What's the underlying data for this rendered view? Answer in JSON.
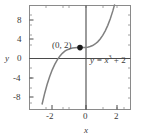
{
  "chart_data": {
    "type": "line",
    "title": "",
    "xlabel": "x",
    "ylabel": "y",
    "equation_label": "y = x",
    "equation_exponent": "3",
    "equation_tail": " + 2",
    "equation_full": "y = x^3 + 2",
    "function": "y = x^3 + 2",
    "xlim": [
      -3,
      3
    ],
    "ylim": [
      -10.5,
      10.5
    ],
    "grid": false,
    "legend": "none",
    "xticks": [
      -2,
      0,
      2
    ],
    "xtick_labels": [
      "-2",
      "0",
      "2"
    ],
    "yticks": [
      -8,
      -4,
      0,
      4,
      8
    ],
    "ytick_labels": [
      "-8",
      "-4",
      "0",
      "4",
      "8"
    ],
    "minor_xticks": [
      -2.5,
      -1.5,
      -1,
      -0.5,
      0.5,
      1,
      1.5,
      2.5
    ],
    "minor_yticks": [
      -10,
      -9,
      -7,
      -6,
      -5,
      -3,
      -2,
      -1,
      1,
      2,
      3,
      5,
      6,
      7,
      9,
      10
    ],
    "annotations": [
      {
        "name": "y-intercept-point",
        "label": "(0, 2)",
        "x": 0,
        "y": 2,
        "marker": "filled-circle"
      }
    ],
    "series": [
      {
        "name": "cubic-curve",
        "color": "#808080",
        "x": [
          -2.25,
          -2.1,
          -1.95,
          -1.8,
          -1.65,
          -1.5,
          -1.35,
          -1.2,
          -1.05,
          -0.9,
          -0.75,
          -0.6,
          -0.45,
          -0.3,
          -0.15,
          0,
          0.15,
          0.3,
          0.45,
          0.6,
          0.75,
          0.9,
          1.05,
          1.2,
          1.35,
          1.5,
          1.65,
          1.8,
          1.95,
          2.05
        ],
        "y": [
          -9.39,
          -7.26,
          -5.41,
          -3.83,
          -2.49,
          -1.38,
          -0.46,
          0.27,
          0.84,
          1.27,
          1.58,
          1.78,
          1.91,
          1.97,
          2.0,
          2.0,
          2.0,
          2.03,
          2.09,
          2.22,
          2.42,
          2.73,
          3.16,
          3.73,
          4.46,
          5.38,
          6.49,
          7.83,
          9.41,
          10.62
        ]
      }
    ]
  },
  "colors": {
    "curve": "#808080",
    "axis": "#4a4a4a",
    "frame": "#8a8a8a",
    "text": "#3a3a3a",
    "marker": "#1a1a1a",
    "background": "#ffffff"
  }
}
